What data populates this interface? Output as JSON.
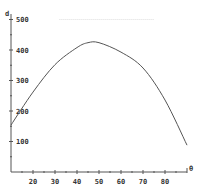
{
  "chart_data": {
    "type": "line",
    "title": "",
    "xlabel": "θ",
    "ylabel": "d",
    "xlim": [
      10,
      90
    ],
    "ylim": [
      0,
      500
    ],
    "grid": false,
    "legend": null,
    "x_ticks": [
      20,
      30,
      40,
      50,
      60,
      70,
      80
    ],
    "y_ticks": [
      100,
      200,
      300,
      400,
      500
    ],
    "series": [
      {
        "name": "d",
        "x": [
          10,
          20,
          30,
          40,
          45,
          50,
          60,
          70,
          80,
          90
        ],
        "values": [
          154,
          262,
          352,
          408,
          424,
          424,
          393,
          341,
          236,
          88
        ]
      }
    ],
    "annotations": [
      {
        "type": "dotted-reference-line",
        "y": 500,
        "x_range": [
          32,
          75
        ]
      }
    ]
  },
  "colors": {
    "axis": "#555555",
    "curve": "#555555",
    "text": "#333333",
    "reference": "#dddddd"
  }
}
